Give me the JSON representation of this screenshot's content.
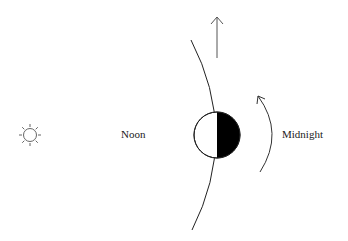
{
  "diagram": {
    "labels": {
      "noon": "Noon",
      "midnight": "Midnight"
    },
    "icons": {
      "sun": "sun-icon",
      "moon": "half-lit-earth-moon",
      "orbit_direction": "up-arrow-icon",
      "rotation_direction": "curved-arrow-icon"
    },
    "colors": {
      "stroke": "#222222",
      "dark_side": "#000000",
      "lit_side": "#ffffff",
      "sun_stroke": "#555555"
    }
  }
}
